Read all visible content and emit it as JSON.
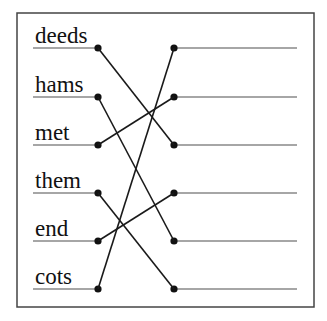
{
  "diagram": {
    "type": "matching-exercise",
    "colors": {
      "border": "#444444",
      "underline": "#888888",
      "connector": "#1a1a1a",
      "text": "#111111"
    },
    "left_words": [
      "deeds",
      "hams",
      "met",
      "them",
      "end",
      "cots"
    ],
    "right_slots": [
      "",
      "",
      "",
      "",
      "",
      ""
    ],
    "connections": [
      {
        "from": "deeds",
        "to_slot": 3
      },
      {
        "from": "hams",
        "to_slot": 5
      },
      {
        "from": "met",
        "to_slot": 2
      },
      {
        "from": "them",
        "to_slot": 6
      },
      {
        "from": "end",
        "to_slot": 4
      },
      {
        "from": "cots",
        "to_slot": 1
      }
    ]
  }
}
